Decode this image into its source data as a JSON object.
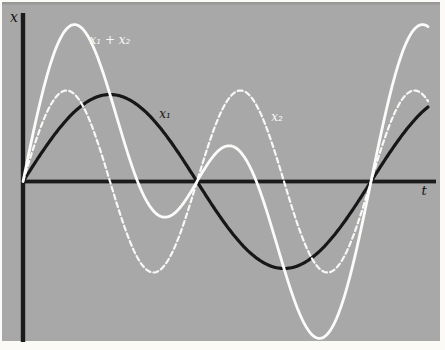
{
  "figure": {
    "page_color": "#fbfaf7",
    "background_color": "#a8a8a8",
    "top_edge_color": "#8c8c8c",
    "axis_color": "#1b1b1b"
  },
  "chart_data": {
    "type": "line",
    "title": "",
    "xlabel": "t",
    "ylabel": "x",
    "grid": false,
    "legend_position": "inline-curve-labels",
    "model": {
      "x1": "x1(t) = A1 sin(w t)",
      "x2": "x2(t) = A2 sin(2w t)",
      "sum": "x1(t) + x2(t)"
    },
    "series": [
      {
        "name": "x1",
        "label": "x₁",
        "color": "#171717",
        "line_style": "solid",
        "stroke_width": 3.2,
        "amplitude_px": 87,
        "period_px": 348,
        "phase": 0
      },
      {
        "name": "x2",
        "label": "x₂",
        "color": "#f8f8f5",
        "line_style": "dashed",
        "dash": "5 3.2",
        "stroke_width": 2.2,
        "amplitude_px": 91,
        "period_px": 174,
        "phase": 0
      },
      {
        "name": "x1_plus_x2",
        "label": "x₁ + x₂",
        "color": "#fbfbf9",
        "line_style": "solid",
        "stroke_width": 2.8,
        "sum_of": [
          "x1",
          "x2"
        ]
      }
    ],
    "layout_px": {
      "plot_rect": [
        2,
        2,
        438,
        339
      ],
      "origin": [
        23,
        181.5
      ],
      "x_axis_start": 21,
      "x_axis_end": 436,
      "y_axis_top": 13,
      "y_axis_bottom": 342,
      "axis_thickness": 3.8,
      "curve_t_end": 405,
      "sample_step": 1.5
    },
    "axis_labels": {
      "y": {
        "text": "x",
        "x_px": 14,
        "y_px": 22,
        "font_px": 14,
        "color": "#141414"
      },
      "x": {
        "text": "t",
        "x_px": 424,
        "y_px": 195,
        "font_px": 13,
        "color": "#141414"
      }
    },
    "annotations": [
      {
        "text": "x₁ + x₂",
        "series": "x1_plus_x2",
        "color": "#fafaf7",
        "x_px": 110,
        "y_px": 44,
        "font_px": 12
      },
      {
        "text": "x₁",
        "series": "x1",
        "color": "#141414",
        "x_px": 165,
        "y_px": 118,
        "font_px": 12
      },
      {
        "text": "x₂",
        "series": "x2",
        "color": "#fafaf7",
        "x_px": 277,
        "y_px": 121,
        "font_px": 12
      }
    ]
  }
}
